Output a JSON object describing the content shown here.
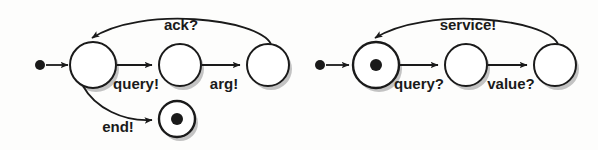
{
  "figure": {
    "kind": "state-machine-pair",
    "background_color": "#fdfdfc",
    "stroke_color": "#1a1a1a",
    "shadow_color": "#b9b9b9"
  },
  "machines": [
    {
      "id": "client-machine",
      "name": "left-state-machine",
      "states": [
        {
          "id": "L0",
          "name": "initial-marker",
          "shape": "filled-dot",
          "cx": 40,
          "cy": 65,
          "r": 5
        },
        {
          "id": "L1",
          "name": "state-idle",
          "shape": "circle",
          "cx": 93,
          "cy": 65,
          "r": 23
        },
        {
          "id": "L2",
          "name": "state-waiting",
          "shape": "circle",
          "cx": 180,
          "cy": 65,
          "r": 21
        },
        {
          "id": "L3",
          "name": "state-received",
          "shape": "circle",
          "cx": 268,
          "cy": 65,
          "r": 21
        },
        {
          "id": "L4",
          "name": "state-final",
          "shape": "circle-dot",
          "cx": 177,
          "cy": 119,
          "r": 18,
          "dot_r": 6
        }
      ],
      "transitions": [
        {
          "id": "L-start",
          "name": "start-arrow",
          "label": "",
          "from": "L0",
          "to": "L1"
        },
        {
          "id": "L-query",
          "name": "query-edge",
          "label": "query!",
          "from": "L1",
          "to": "L2",
          "label_x": 136,
          "label_y": 89
        },
        {
          "id": "L-arg",
          "name": "arg-edge",
          "label": "arg!",
          "from": "L2",
          "to": "L3",
          "label_x": 224,
          "label_y": 89
        },
        {
          "id": "L-ack",
          "name": "ack-edge",
          "label": "ack?",
          "from": "L3",
          "to": "L1",
          "label_x": 181,
          "label_y": 30
        },
        {
          "id": "L-end",
          "name": "end-edge",
          "label": "end!",
          "from": "L1",
          "to": "L4",
          "label_x": 118,
          "label_y": 132
        }
      ]
    },
    {
      "id": "server-machine",
      "name": "right-state-machine",
      "states": [
        {
          "id": "R0",
          "name": "initial-marker",
          "shape": "filled-dot",
          "cx": 320,
          "cy": 65,
          "r": 5
        },
        {
          "id": "R1",
          "name": "state-ready",
          "shape": "circle-dot",
          "cx": 376,
          "cy": 65,
          "r": 23,
          "dot_r": 6
        },
        {
          "id": "R2",
          "name": "state-serving",
          "shape": "circle",
          "cx": 466,
          "cy": 65,
          "r": 21
        },
        {
          "id": "R3",
          "name": "state-responding",
          "shape": "circle",
          "cx": 555,
          "cy": 65,
          "r": 21
        }
      ],
      "transitions": [
        {
          "id": "R-start",
          "name": "start-arrow",
          "label": "",
          "from": "R0",
          "to": "R1"
        },
        {
          "id": "R-query",
          "name": "query-edge",
          "label": "query?",
          "from": "R1",
          "to": "R2",
          "label_x": 419,
          "label_y": 89
        },
        {
          "id": "R-value",
          "name": "value-edge",
          "label": "value?",
          "from": "R2",
          "to": "R3",
          "label_x": 511,
          "label_y": 89
        },
        {
          "id": "R-service",
          "name": "service-edge",
          "label": "service!",
          "from": "R3",
          "to": "R1",
          "label_x": 468,
          "label_y": 30
        }
      ]
    }
  ]
}
